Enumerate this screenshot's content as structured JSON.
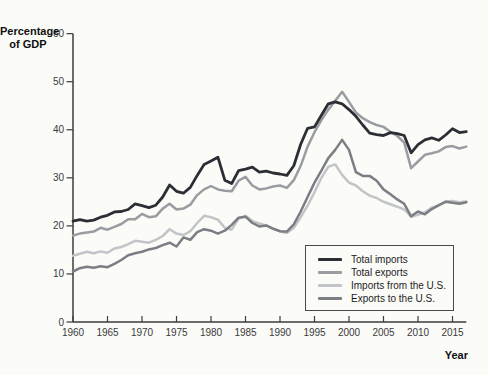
{
  "chart_data": {
    "type": "line",
    "title": "",
    "ylabel": "Percentage of GDP",
    "ylabel_lines": [
      "Percentage",
      "of GDP"
    ],
    "xlabel": "Year",
    "xlim": [
      1960,
      2017
    ],
    "ylim": [
      0,
      60
    ],
    "x_ticks": [
      1960,
      1965,
      1970,
      1975,
      1980,
      1985,
      1990,
      1995,
      2000,
      2005,
      2010,
      2015
    ],
    "y_ticks": [
      0,
      10,
      20,
      30,
      40,
      50,
      60
    ],
    "grid": false,
    "legend_position": "inside-bottom-right",
    "x": [
      1960,
      1961,
      1962,
      1963,
      1964,
      1965,
      1966,
      1967,
      1968,
      1969,
      1970,
      1971,
      1972,
      1973,
      1974,
      1975,
      1976,
      1977,
      1978,
      1979,
      1980,
      1981,
      1982,
      1983,
      1984,
      1985,
      1986,
      1987,
      1988,
      1989,
      1990,
      1991,
      1992,
      1993,
      1994,
      1995,
      1996,
      1997,
      1998,
      1999,
      2000,
      2001,
      2002,
      2003,
      2004,
      2005,
      2006,
      2007,
      2008,
      2009,
      2010,
      2011,
      2012,
      2013,
      2014,
      2015,
      2016,
      2017
    ],
    "series": [
      {
        "name": "Total imports",
        "color": "#2b2e34",
        "values": [
          21,
          21.3,
          21,
          21.2,
          21.8,
          22.2,
          22.9,
          23,
          23.4,
          24.6,
          24.2,
          23.8,
          24.3,
          26,
          28.5,
          27.2,
          26.8,
          28,
          30.5,
          32.8,
          33.5,
          34.3,
          29.5,
          28.8,
          31.5,
          31.8,
          32.2,
          31.2,
          31.4,
          31,
          30.8,
          30.5,
          32.5,
          37,
          40.3,
          40.6,
          43,
          45.4,
          45.8,
          45.4,
          44.2,
          42.8,
          41,
          39.3,
          39,
          38.8,
          39.4,
          39.2,
          38.8,
          35.2,
          36.9,
          37.9,
          38.3,
          37.8,
          38.9,
          40.2,
          39.4,
          39.6
        ]
      },
      {
        "name": "Total exports",
        "color": "#999da2",
        "values": [
          18,
          18.4,
          18.6,
          18.8,
          19.6,
          19.2,
          19.8,
          20.4,
          21.4,
          21.4,
          22.5,
          21.8,
          22,
          23.6,
          24.6,
          23.4,
          23.6,
          24.4,
          26.4,
          27.6,
          28.3,
          27.6,
          27.3,
          27.2,
          29.4,
          30.2,
          28.4,
          27.6,
          27.8,
          28.2,
          28.4,
          27.9,
          29.5,
          32.5,
          36.5,
          39.5,
          42,
          44.2,
          46,
          47.9,
          45.8,
          43.6,
          42.4,
          41.6,
          41,
          40.6,
          39.6,
          38.7,
          37.3,
          32,
          33.4,
          34.8,
          35.1,
          35.5,
          36.4,
          36.6,
          36.1,
          36.5
        ]
      },
      {
        "name": "Imports from the U.S.",
        "color": "#c2c5c8",
        "values": [
          13.8,
          14.2,
          14.6,
          14.3,
          14.7,
          14.4,
          15.3,
          15.6,
          16.2,
          16.9,
          16.7,
          16.5,
          17.1,
          17.9,
          19.3,
          18.4,
          18.1,
          18.9,
          20.6,
          22.1,
          21.8,
          21.3,
          19.6,
          19.2,
          21.5,
          22.1,
          21,
          20.5,
          20.1,
          19.5,
          18.9,
          18.5,
          19.6,
          21.8,
          24.2,
          27,
          30,
          32.3,
          32.8,
          30.6,
          29,
          28.4,
          27.2,
          26.3,
          25.8,
          25,
          24.5,
          24,
          23.4,
          21.9,
          22.3,
          22.8,
          23.8,
          24.2,
          25.1,
          25.2,
          24.9,
          25.1
        ]
      },
      {
        "name": "Exports to the U.S.",
        "color": "#7b7e84",
        "values": [
          10.5,
          11.2,
          11.5,
          11.3,
          11.6,
          11.4,
          12.1,
          12.9,
          13.9,
          14.3,
          14.6,
          15.1,
          15.4,
          16,
          16.5,
          15.7,
          17.6,
          17.1,
          18.7,
          19.3,
          19,
          18.4,
          19,
          20.2,
          21.7,
          21.9,
          20.6,
          19.9,
          20.1,
          19.4,
          18.9,
          18.8,
          20.3,
          23,
          26,
          29,
          31.5,
          34.1,
          35.8,
          37.9,
          35.8,
          31.2,
          30.4,
          30.4,
          29.4,
          27.6,
          26.6,
          25.5,
          24.6,
          22,
          23,
          22.4,
          23.5,
          24.3,
          25,
          24.8,
          24.6,
          24.9
        ]
      }
    ]
  }
}
